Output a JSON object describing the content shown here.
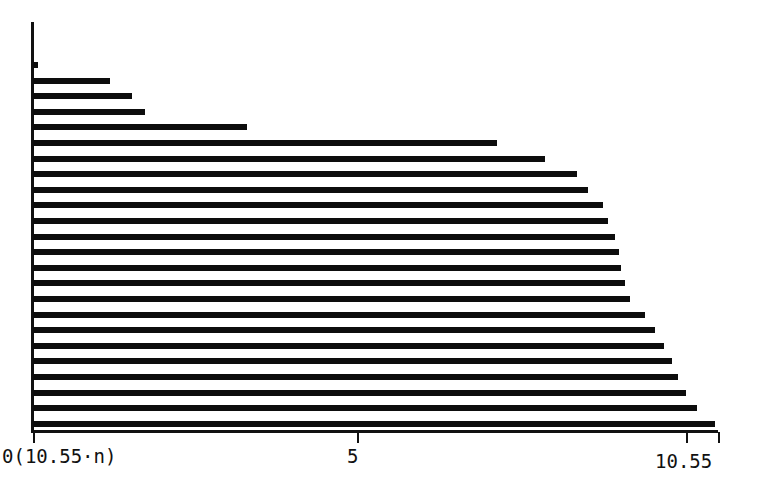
{
  "chart_data": {
    "type": "bar",
    "orientation": "horizontal",
    "title": "",
    "subtitle": "",
    "xlabel": "",
    "ylabel": "",
    "xlim": [
      0,
      10.55
    ],
    "ylim": [
      0,
      24
    ],
    "grid": false,
    "legend": null,
    "axis_color": "#111111",
    "bar_color": "#0d0d0d",
    "background_color": "#ffffff",
    "xticks": [
      {
        "value": 0,
        "label": "0(10.55·n)",
        "pixel_x": 33
      },
      {
        "value": 5,
        "label": "5",
        "pixel_x": 357
      },
      {
        "value": 10.05,
        "label": "",
        "pixel_x": 686
      },
      {
        "value": 10.55,
        "label": "10.55",
        "pixel_x": 718
      }
    ],
    "tick_labels": [
      "0(10.55·n)",
      "5",
      "10.55"
    ],
    "categories": [
      "1",
      "2",
      "3",
      "4",
      "5",
      "6",
      "7",
      "8",
      "9",
      "10",
      "11",
      "12",
      "13",
      "14",
      "15",
      "16",
      "17",
      "18",
      "19",
      "20",
      "21",
      "22",
      "23",
      "24"
    ],
    "values": [
      0.08,
      1.18,
      1.52,
      1.72,
      3.3,
      7.15,
      7.88,
      8.38,
      8.55,
      8.78,
      8.86,
      8.96,
      9.02,
      9.06,
      9.12,
      9.2,
      9.42,
      9.58,
      9.72,
      9.84,
      9.94,
      10.06,
      10.22,
      10.51
    ],
    "bar_geometry": {
      "x_origin_px": 33,
      "x_full_px": 718,
      "first_bar_top_px": 62,
      "row_pitch_px": 15.6,
      "bar_thickness_px": 6
    }
  }
}
